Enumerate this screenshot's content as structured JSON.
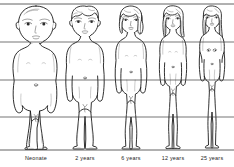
{
  "figure": {
    "background_color": "#ffffff",
    "line_color": "#3a3a3a",
    "ink_color": "#1a1a1a",
    "width": 234,
    "height": 167
  },
  "reference_lines": {
    "description": "Horizontal proportion reference lines drawn across all figures",
    "top_y": 4,
    "baseline_y": 150,
    "intermediate_y": [
      42,
      80,
      117
    ]
  },
  "captions": [
    {
      "label": "Neonate",
      "x": 36,
      "y": 160
    },
    {
      "label": "2 years",
      "x": 85,
      "y": 160
    },
    {
      "label": "6 years",
      "x": 131,
      "y": 160
    },
    {
      "label": "12 years",
      "x": 173,
      "y": 160
    },
    {
      "label": "25 years",
      "x": 212,
      "y": 160
    }
  ],
  "subjects": [
    {
      "id": "neonate",
      "label": "Neonate",
      "center_x": 36,
      "head_top_y": 6,
      "foot_y": 150,
      "head_height_ratio": "1/4",
      "hair": "none",
      "build": "infant"
    },
    {
      "id": "two-years",
      "label": "2 years",
      "center_x": 85,
      "head_top_y": 6,
      "foot_y": 150,
      "head_height_ratio": "1/5",
      "hair": "short-curly",
      "build": "toddler"
    },
    {
      "id": "six-years",
      "label": "6 years",
      "center_x": 131,
      "head_top_y": 6,
      "foot_y": 150,
      "head_height_ratio": "1/6",
      "hair": "chin-length",
      "build": "child"
    },
    {
      "id": "twelve-years",
      "label": "12 years",
      "center_x": 173,
      "head_top_y": 6,
      "foot_y": 150,
      "head_height_ratio": "1/7",
      "hair": "shoulder-length",
      "build": "adolescent"
    },
    {
      "id": "twentyfive-years",
      "label": "25 years",
      "center_x": 212,
      "head_top_y": 6,
      "foot_y": 150,
      "head_height_ratio": "1/8",
      "hair": "long",
      "build": "adult"
    }
  ]
}
